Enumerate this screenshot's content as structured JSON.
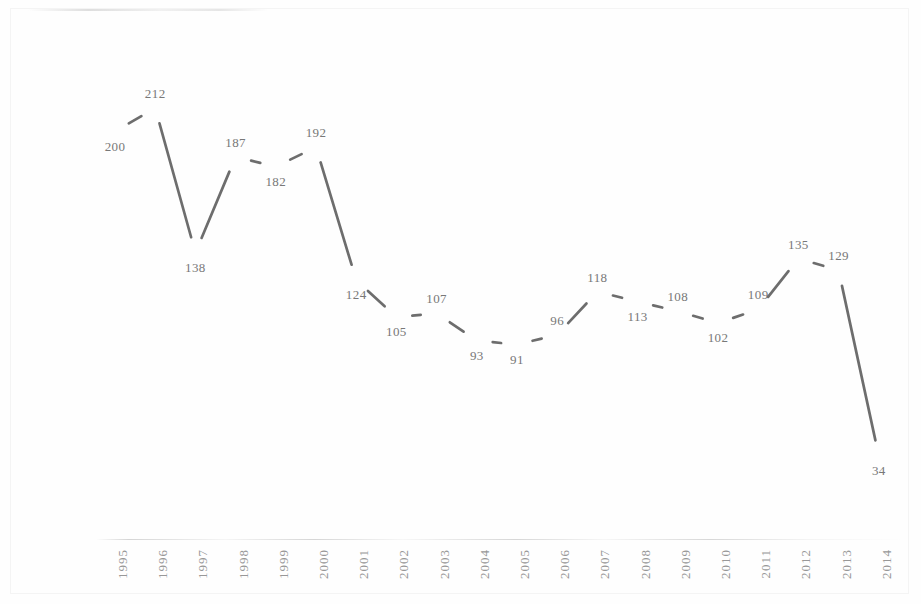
{
  "chart_data": {
    "type": "line",
    "title": "",
    "subtitle": "",
    "xlabel": "",
    "ylabel": "",
    "grid": false,
    "legend": "none",
    "y_axis_visible": false,
    "x_axis_visible": true,
    "x_tick_rotation_degrees": 90,
    "data_labels_shown": true,
    "ylim": [
      0,
      230
    ],
    "categories": [
      "1995",
      "1996",
      "1997",
      "1998",
      "1999",
      "2000",
      "2001",
      "2002",
      "2003",
      "2004",
      "2005",
      "2006",
      "2007",
      "2008",
      "2009",
      "2010",
      "2011",
      "2012",
      "2013",
      "2014"
    ],
    "values": [
      200,
      212,
      138,
      187,
      182,
      192,
      124,
      105,
      107,
      93,
      91,
      96,
      118,
      113,
      108,
      102,
      109,
      135,
      129,
      34
    ],
    "point_labels": [
      "200",
      "212",
      "138",
      "187",
      "182",
      "192",
      "124",
      "105",
      "107",
      "93",
      "91",
      "96",
      "118",
      "113",
      "108",
      "102",
      "109",
      "135",
      "129",
      "34"
    ],
    "series": [
      {
        "name": "",
        "values": [
          200,
          212,
          138,
          187,
          182,
          192,
          124,
          105,
          107,
          93,
          91,
          96,
          118,
          113,
          108,
          102,
          109,
          135,
          129,
          34
        ]
      }
    ],
    "max_value": 212,
    "max_value_category": "1996",
    "min_value": 34,
    "min_value_category": "2014"
  },
  "style": {
    "line_color": "#5d5d5d",
    "label_color": "#6d6d6d",
    "tick_color": "#8a8a8a",
    "axis_color": "#cecece",
    "background_color": "#fefefe"
  }
}
